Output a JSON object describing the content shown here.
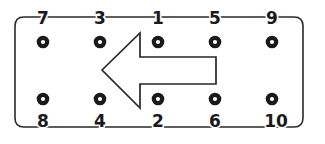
{
  "diagram": {
    "type": "cylinder-head-torque-sequence",
    "canvas": {
      "width": 325,
      "height": 144,
      "background": "#ffffff"
    },
    "stroke_color": "#2a2a2a",
    "number_color": "#1a1a1a",
    "gasket_outline": {
      "x": 15,
      "y": 17,
      "width": 288,
      "height": 110,
      "corner_radius": 9
    },
    "front_arrow": {
      "label": "front-of-engine-arrow",
      "direction": "left",
      "tip_x": 102,
      "tip_y": 70,
      "head_back_x": 140,
      "head_top_y": 33,
      "head_bottom_y": 108,
      "shaft_end_x": 216,
      "shaft_top_y": 57,
      "shaft_bottom_y": 84,
      "fill": "#ffffff",
      "stroke": "#262626"
    },
    "bolt_radius": 4.2,
    "bolts": [
      {
        "label": "7",
        "sequence": 7,
        "cx": 43,
        "cy": 42,
        "row": "top",
        "label_x": 43,
        "label_y": 24
      },
      {
        "label": "3",
        "sequence": 3,
        "cx": 100,
        "cy": 42,
        "row": "top",
        "label_x": 100,
        "label_y": 24
      },
      {
        "label": "1",
        "sequence": 1,
        "cx": 158,
        "cy": 42,
        "row": "top",
        "label_x": 158,
        "label_y": 24
      },
      {
        "label": "5",
        "sequence": 5,
        "cx": 215,
        "cy": 42,
        "row": "top",
        "label_x": 215,
        "label_y": 24
      },
      {
        "label": "9",
        "sequence": 9,
        "cx": 272,
        "cy": 42,
        "row": "top",
        "label_x": 272,
        "label_y": 24
      },
      {
        "label": "8",
        "sequence": 8,
        "cx": 43,
        "cy": 99,
        "row": "bottom",
        "label_x": 43,
        "label_y": 127
      },
      {
        "label": "4",
        "sequence": 4,
        "cx": 100,
        "cy": 99,
        "row": "bottom",
        "label_x": 100,
        "label_y": 127
      },
      {
        "label": "2",
        "sequence": 2,
        "cx": 158,
        "cy": 99,
        "row": "bottom",
        "label_x": 158,
        "label_y": 127
      },
      {
        "label": "6",
        "sequence": 6,
        "cx": 215,
        "cy": 99,
        "row": "bottom",
        "label_x": 215,
        "label_y": 127
      },
      {
        "label": "10",
        "sequence": 10,
        "cx": 272,
        "cy": 99,
        "row": "bottom",
        "label_x": 276,
        "label_y": 127
      }
    ]
  }
}
